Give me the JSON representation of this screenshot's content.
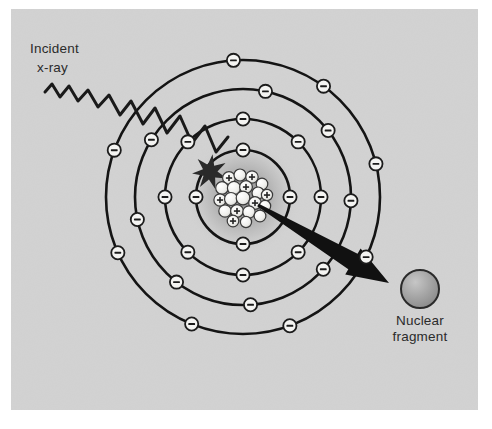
{
  "figure": {
    "panel": {
      "background_color": "#d2d2d2",
      "x": 11,
      "y": 9,
      "width": 467,
      "height": 401
    },
    "canvas": {
      "width": 492,
      "height": 429,
      "background_color": "#ffffff"
    }
  },
  "labels": {
    "incident_xray": {
      "line1": "Incident",
      "line2": "x-ray"
    },
    "nuclear_fragment": {
      "line1": "Nuclear",
      "line2": "fragment"
    }
  },
  "atom": {
    "center": {
      "x": 243,
      "y": 197
    },
    "nucleus": {
      "halo_radius": 58,
      "cluster_radius": 27,
      "nucleon_color": "#f2f2ef",
      "nucleon_outline": "#3a3a3a",
      "proton_marker": "+",
      "nucleons": [
        {
          "x": -14,
          "y": -19,
          "r": 6.4,
          "charge": "+"
        },
        {
          "x": -3,
          "y": -22,
          "r": 6.0,
          "charge": ""
        },
        {
          "x": 9,
          "y": -20,
          "r": 6.2,
          "charge": "+"
        },
        {
          "x": 19,
          "y": -13,
          "r": 5.8,
          "charge": ""
        },
        {
          "x": -21,
          "y": -9,
          "r": 6.3,
          "charge": ""
        },
        {
          "x": -9,
          "y": -9,
          "r": 6.6,
          "charge": ""
        },
        {
          "x": 3,
          "y": -10,
          "r": 6.4,
          "charge": "+"
        },
        {
          "x": 15,
          "y": -4,
          "r": 6.0,
          "charge": ""
        },
        {
          "x": 24,
          "y": -2,
          "r": 5.6,
          "charge": "+"
        },
        {
          "x": -23,
          "y": 3,
          "r": 6.1,
          "charge": "+"
        },
        {
          "x": -12,
          "y": 2,
          "r": 6.5,
          "charge": ""
        },
        {
          "x": 0,
          "y": 1,
          "r": 6.8,
          "charge": ""
        },
        {
          "x": 12,
          "y": 6,
          "r": 6.3,
          "charge": "+"
        },
        {
          "x": 22,
          "y": 9,
          "r": 5.7,
          "charge": ""
        },
        {
          "x": -18,
          "y": 14,
          "r": 6.2,
          "charge": ""
        },
        {
          "x": -6,
          "y": 14,
          "r": 6.4,
          "charge": "+"
        },
        {
          "x": 6,
          "y": 15,
          "r": 6.2,
          "charge": ""
        },
        {
          "x": 17,
          "y": 19,
          "r": 5.9,
          "charge": ""
        },
        {
          "x": -10,
          "y": 24,
          "r": 5.8,
          "charge": "+"
        },
        {
          "x": 3,
          "y": 25,
          "r": 5.6,
          "charge": ""
        }
      ]
    },
    "electron": {
      "radius": 6.6,
      "fill": "#f4f4f2",
      "outline": "#1c1c1c",
      "marker": "–"
    },
    "shells": [
      {
        "name": "shell-1",
        "radius": 47,
        "electron_count": 4,
        "electron_angles": [
          -90,
          0,
          90,
          180
        ]
      },
      {
        "name": "shell-2",
        "radius": 78,
        "electron_count": 8,
        "electron_angles": [
          -90,
          -45,
          0,
          45,
          90,
          135,
          180,
          225
        ]
      },
      {
        "name": "shell-3",
        "radius": 108,
        "electron_count": 8,
        "electron_angles": [
          -78,
          -38,
          2,
          42,
          86,
          128,
          168,
          212
        ]
      },
      {
        "name": "shell-4",
        "radius": 137,
        "electron_count": 8,
        "electron_angles": [
          -94,
          -54,
          -14,
          26,
          70,
          112,
          156,
          200
        ]
      }
    ],
    "shell_stroke": "#141414",
    "shell_stroke_width": 2.6
  },
  "xray": {
    "stroke": "#1a1a1a",
    "stroke_width": 3.0,
    "path": "M 45 92 L 52 84 L 60 97 L 69 86 L 78 101 L 88 90 L 98 107 L 109 95 L 120 115 L 131 101 L 143 124 L 155 108 L 167 133 L 180 116 L 192 143 L 205 126 L 216 152 L 228 137",
    "impact": {
      "x": 210,
      "y": 172,
      "description": "starburst collision marker",
      "color": "#2a2a2a"
    }
  },
  "fragment_arrow": {
    "from": {
      "x": 258,
      "y": 205
    },
    "to": {
      "x": 389,
      "y": 283
    },
    "color": "#111111",
    "tail_width": 3,
    "head_width": 30
  },
  "nuclear_fragment_sphere": {
    "center": {
      "x": 420,
      "y": 289
    },
    "radius": 19,
    "fill": "#a8a8a8",
    "outline": "#2a2a2a"
  }
}
